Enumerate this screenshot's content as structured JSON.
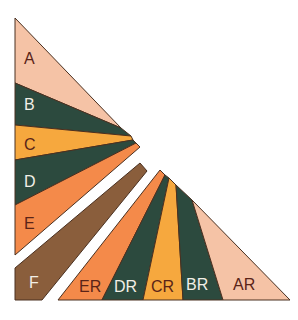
{
  "colors": {
    "peach": "#f5c3a6",
    "dark_green": "#2c4a3e",
    "orange": "#f6a83e",
    "coral": "#f48a4a",
    "brown": "#8a5e3c",
    "outline": "#4a3020",
    "text_dark": "#5a2418",
    "text_light": "#f2efe6"
  },
  "left_bands": [
    {
      "label": "A",
      "color": "peach"
    },
    {
      "label": "B",
      "color": "dark_green"
    },
    {
      "label": "C",
      "color": "orange"
    },
    {
      "label": "D",
      "color": "dark_green"
    },
    {
      "label": "E",
      "color": "coral"
    }
  ],
  "strip": {
    "label": "F",
    "color": "brown"
  },
  "bottom_bands": [
    {
      "label": "ER",
      "color": "coral"
    },
    {
      "label": "DR",
      "color": "dark_green"
    },
    {
      "label": "CR",
      "color": "orange"
    },
    {
      "label": "BR",
      "color": "dark_green"
    },
    {
      "label": "AR",
      "color": "peach"
    }
  ]
}
